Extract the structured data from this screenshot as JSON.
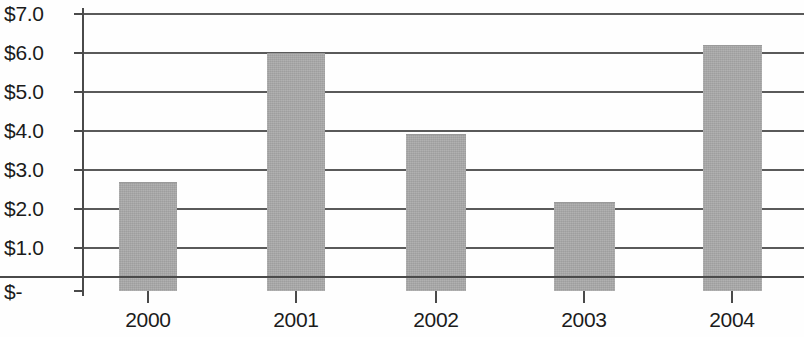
{
  "chart_data": {
    "type": "bar",
    "title": "",
    "xlabel": "",
    "ylabel": "",
    "categories": [
      "2000",
      "2001",
      "2002",
      "2003",
      "2004"
    ],
    "values": [
      2.72,
      6.0,
      3.95,
      2.23,
      6.2
    ],
    "series": [
      {
        "name": "",
        "values": [
          2.72,
          6.0,
          3.95,
          2.23,
          6.2
        ]
      }
    ],
    "ylim": [
      0,
      7
    ],
    "ytick_values": [
      7,
      6,
      5,
      4,
      3,
      2,
      1,
      0
    ],
    "ytick_labels": [
      "$7.0",
      "$6.0",
      "$5.0",
      "$4.0",
      "$3.0",
      "$2.0",
      "$1.0",
      "$-"
    ],
    "xtick_labels": [
      "2000",
      "2001",
      "2002",
      "2003",
      "2004"
    ],
    "grid": true,
    "grid_axis": "y",
    "legend": false,
    "legend_position": "none",
    "bar_color": "#a9a9a9",
    "axis_color": "#4a4a4a",
    "grid_color": "#5a5a5a",
    "text_color": "#1b1b1b",
    "annotations": []
  },
  "layout": {
    "ygrid_px": [
      13,
      52,
      91,
      130,
      169,
      208,
      247,
      290
    ],
    "bars_px": [
      {
        "left": 119,
        "width": 58,
        "top": 180
      },
      {
        "left": 267,
        "width": 58,
        "top": 52
      },
      {
        "left": 406,
        "width": 60,
        "top": 132
      },
      {
        "left": 554,
        "width": 61,
        "top": 199
      },
      {
        "left": 703,
        "width": 59,
        "top": 44
      }
    ],
    "xtick_px": [
      148,
      296,
      436,
      584,
      732
    ]
  }
}
